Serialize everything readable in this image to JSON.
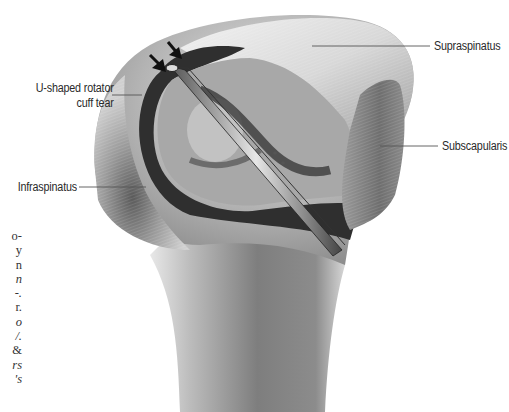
{
  "figure": {
    "labels": {
      "supraspinatus": "Supraspinatus",
      "subscapularis": "Subscapularis",
      "infraspinatus": "Infraspinatus",
      "tear_line1": "U-shaped rotator",
      "tear_line2": "cuff tear"
    },
    "arrows_count": 2
  },
  "caption_fragment": {
    "lines": [
      {
        "text": "o-",
        "italic": false
      },
      {
        "text": "y",
        "italic": false
      },
      {
        "text": "n",
        "italic": false
      },
      {
        "text": "n",
        "italic": true
      },
      {
        "text": "-.",
        "italic": true
      },
      {
        "text": "r.",
        "italic": false
      },
      {
        "text": "o",
        "italic": true
      },
      {
        "text": "/.",
        "italic": true
      },
      {
        "text": "&",
        "italic": false
      },
      {
        "text": "rs",
        "italic": true
      },
      {
        "text": "'s",
        "italic": true
      }
    ]
  }
}
